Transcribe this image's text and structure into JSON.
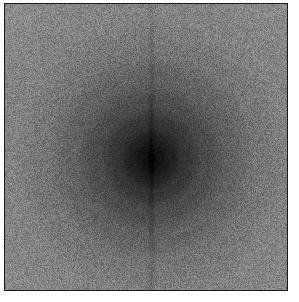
{
  "figure": {
    "title": "",
    "kind": "grayscale-noise-field-with-radial-dark-core",
    "canvas": {
      "width": 299,
      "height": 302,
      "background": "#ffffff"
    },
    "frame": {
      "border_color": "#1a1a1a",
      "border_width": 1,
      "left": 4,
      "top": 3,
      "width": 284,
      "height": 288
    }
  },
  "chart_data": {
    "type": "heatmap",
    "title": "",
    "subtitle": "",
    "xlabel": "",
    "ylabel": "",
    "legend": [],
    "annotations": [],
    "grid": false,
    "colormap": "grayscale",
    "axis_ticks_visible": false,
    "axis_labels_visible": false,
    "width_px": 282,
    "height_px": 286,
    "value_range": [
      0,
      255
    ],
    "background_level": 138,
    "core_level": 13,
    "noise": {
      "type": "uniform-speckle",
      "grain_px": 1,
      "amplitude": 34
    },
    "radial_profile": {
      "center_x": 146,
      "center_y": 154,
      "description": "Smooth radial darkening from mid-gray background toward a near-black core",
      "stops": [
        {
          "radius": 0,
          "level": 13
        },
        {
          "radius": 10,
          "level": 20
        },
        {
          "radius": 20,
          "level": 33
        },
        {
          "radius": 35,
          "level": 54
        },
        {
          "radius": 55,
          "level": 76
        },
        {
          "radius": 80,
          "level": 98
        },
        {
          "radius": 110,
          "level": 118
        },
        {
          "radius": 145,
          "level": 131
        },
        {
          "radius": 200,
          "level": 138
        }
      ]
    },
    "streaks": [
      {
        "orientation": "vertical",
        "position_px": 146,
        "width_px": 3,
        "darkening": 14,
        "description": "Faint vertical darker column through the center"
      }
    ],
    "colors": {
      "background_gray": "#8a8a8a",
      "core_black": "#0d0d0d",
      "mid_gray": "#5a5a5a",
      "frame_border": "#1a1a1a",
      "page_background": "#ffffff"
    }
  }
}
